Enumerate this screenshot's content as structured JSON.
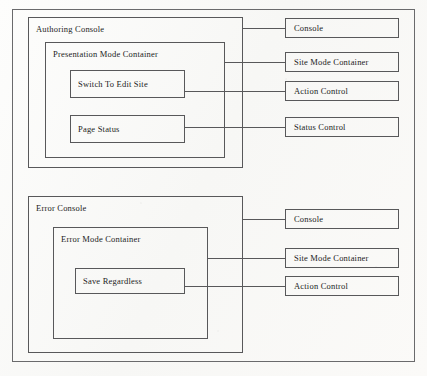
{
  "diagram": {
    "background_color": "#fbfbfa",
    "line_color": "#58585a",
    "text_color": "#1c1c1c",
    "sections": [
      {
        "id": "authoring",
        "console_label": "Authoring Console",
        "mode_container_label": "Presentation Mode Container",
        "controls": [
          {
            "label": "Switch To Edit Site",
            "kind": "action"
          },
          {
            "label": "Page Status",
            "kind": "status"
          }
        ],
        "legend": [
          {
            "label": "Console"
          },
          {
            "label": "Site Mode Container"
          },
          {
            "label": "Action Control"
          },
          {
            "label": "Status Control"
          }
        ]
      },
      {
        "id": "error",
        "console_label": "Error Console",
        "mode_container_label": "Error Mode Container",
        "controls": [
          {
            "label": "Save Regardless",
            "kind": "action"
          }
        ],
        "legend": [
          {
            "label": "Console"
          },
          {
            "label": "Site Mode Container"
          },
          {
            "label": "Action Control"
          }
        ]
      }
    ]
  }
}
